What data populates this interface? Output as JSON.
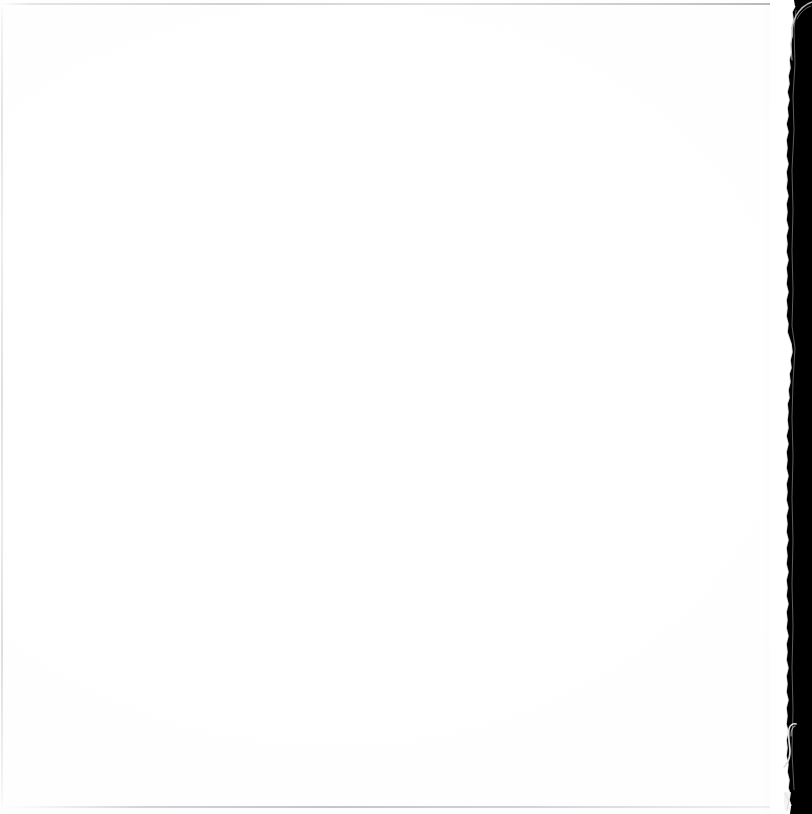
{
  "document": {
    "kind": "scanned-page",
    "page_state": "blank",
    "visible_text": "",
    "page_label": "Blank scanned page",
    "orientation": "portrait"
  },
  "canvas": {
    "width": 812,
    "height": 814,
    "background_color": "#ffffff"
  },
  "sheet": {
    "name": "paper-sheet",
    "color": "#ffffff",
    "left": 0,
    "top": 0,
    "width": 792,
    "height": 814,
    "description": "Blank white paper, no printed content"
  },
  "scanner_void": {
    "name": "dark-margin",
    "color": "#000000",
    "left": 786,
    "top": 0,
    "width": 26,
    "height": 814,
    "description": "Black scanner bed visible past the right edge of the sheet"
  },
  "edges": {
    "top_rule": {
      "color": "#96969e",
      "y": 3,
      "thickness": 2,
      "description": "Faint horizontal scanner guide line along the top"
    },
    "bottom_rule": {
      "color": "#8a8a94",
      "y": 806,
      "thickness": 2,
      "description": "Faint horizontal scanner guide line near the bottom"
    },
    "left_rule": {
      "color": "#b2b2ba",
      "x": 1,
      "thickness": 2,
      "description": "Faint vertical edge line along the left border"
    },
    "right_torn_edge": {
      "color": "#ffffff",
      "x_range": [
        784,
        796
      ],
      "description": "Ragged torn-fibre paper edge against the black margin"
    }
  },
  "artifacts": [
    {
      "name": "top-right-light-streak",
      "color": "#d8d8d8",
      "left": 778,
      "top": 0,
      "width": 34,
      "height": 62,
      "description": "Thin curved light streak in the dark margin at the top-right corner"
    },
    {
      "name": "bottom-right-hook-curl",
      "color": "#e6e6e6",
      "left": 780,
      "top": 718,
      "width": 32,
      "height": 62,
      "description": "Small bright hook-shaped curl of paper in the dark margin"
    },
    {
      "name": "bottom-edge-nick",
      "color": "#f0f0f0",
      "left": 782,
      "top": 792,
      "width": 22,
      "height": 22,
      "description": "Small bright nick at the bottom-right of the sheet edge"
    }
  ]
}
